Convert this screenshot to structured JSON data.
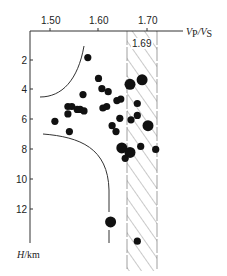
{
  "chart_data": {
    "type": "scatter",
    "title": "",
    "xlabel": "Vp/Vs",
    "ylabel": "H/km",
    "x_axis_position": "top",
    "y_axis_inverted": true,
    "xlim": [
      1.46,
      1.77
    ],
    "ylim": [
      0,
      14.5
    ],
    "x_ticks": [
      1.5,
      1.6,
      1.7
    ],
    "x_tick_labels": [
      "1.50",
      "1.60",
      "1.70"
    ],
    "y_ticks": [
      2,
      4,
      6,
      8,
      10,
      12
    ],
    "y_tick_labels": [
      "2",
      "4",
      "6",
      "8",
      "10",
      "12"
    ],
    "grid": false,
    "legend": null,
    "shaded_band": {
      "x_range": [
        1.655,
        1.72
      ],
      "label": "1.69",
      "pattern": "diagonal-hatch"
    },
    "annotations": [
      {
        "type": "curve",
        "name": "upper-boundary-curve",
        "description": "hyperbola-like curve from (1.48, 4.5) rising to (1.574, 1.0)"
      },
      {
        "type": "curve",
        "name": "lower-boundary-curve",
        "description": "curve from (1.48, 6.9) bending down to vertical near Vp/Vs 1.625 down to ~14 km"
      }
    ],
    "points": [
      {
        "x": 1.578,
        "y": 1.8,
        "size": "small"
      },
      {
        "x": 1.6,
        "y": 3.2,
        "size": "small"
      },
      {
        "x": 1.607,
        "y": 3.9,
        "size": "small"
      },
      {
        "x": 1.62,
        "y": 4.1,
        "size": "small"
      },
      {
        "x": 1.638,
        "y": 4.7,
        "size": "small"
      },
      {
        "x": 1.646,
        "y": 4.6,
        "size": "small"
      },
      {
        "x": 1.665,
        "y": 3.6,
        "size": "large"
      },
      {
        "x": 1.69,
        "y": 3.3,
        "size": "large"
      },
      {
        "x": 1.609,
        "y": 5.2,
        "size": "small"
      },
      {
        "x": 1.617,
        "y": 5.1,
        "size": "small"
      },
      {
        "x": 1.568,
        "y": 4.3,
        "size": "small"
      },
      {
        "x": 1.537,
        "y": 5.1,
        "size": "small"
      },
      {
        "x": 1.545,
        "y": 5.1,
        "size": "small"
      },
      {
        "x": 1.556,
        "y": 5.3,
        "size": "small"
      },
      {
        "x": 1.562,
        "y": 5.3,
        "size": "small"
      },
      {
        "x": 1.57,
        "y": 5.4,
        "size": "small"
      },
      {
        "x": 1.537,
        "y": 5.6,
        "size": "small"
      },
      {
        "x": 1.51,
        "y": 6.1,
        "size": "small"
      },
      {
        "x": 1.54,
        "y": 6.8,
        "size": "small"
      },
      {
        "x": 1.68,
        "y": 4.9,
        "size": "small"
      },
      {
        "x": 1.644,
        "y": 5.9,
        "size": "small"
      },
      {
        "x": 1.628,
        "y": 6.4,
        "size": "small"
      },
      {
        "x": 1.636,
        "y": 6.8,
        "size": "small"
      },
      {
        "x": 1.667,
        "y": 6.0,
        "size": "small"
      },
      {
        "x": 1.68,
        "y": 5.7,
        "size": "small"
      },
      {
        "x": 1.702,
        "y": 6.4,
        "size": "large"
      },
      {
        "x": 1.648,
        "y": 7.9,
        "size": "large"
      },
      {
        "x": 1.665,
        "y": 8.2,
        "size": "large"
      },
      {
        "x": 1.655,
        "y": 8.6,
        "size": "small"
      },
      {
        "x": 1.687,
        "y": 7.8,
        "size": "small"
      },
      {
        "x": 1.718,
        "y": 8.0,
        "size": "small"
      },
      {
        "x": 1.625,
        "y": 12.9,
        "size": "large"
      },
      {
        "x": 1.68,
        "y": 14.2,
        "size": "small"
      }
    ]
  },
  "labels": {
    "x_axis_main": "V",
    "x_axis_sub1": "P",
    "x_axis_slash": "/V",
    "x_axis_sub2": "S",
    "y_axis_main": "H",
    "y_axis_unit": "/km",
    "band_value": "1.69",
    "x_ticks": [
      "1.50",
      "1.60",
      "1.70"
    ],
    "y_ticks": [
      "2",
      "4",
      "6",
      "8",
      "10",
      "12"
    ]
  },
  "colors": {
    "ink": "#111111",
    "axis": "#333333",
    "hatch": "#777777",
    "background": "#ffffff"
  }
}
